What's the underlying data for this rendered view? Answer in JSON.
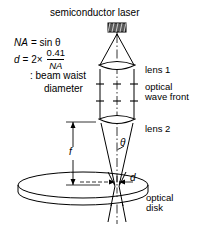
{
  "diagram": {
    "title": "semiconductor laser",
    "formula": {
      "line1_lhs": "NA",
      "line1_rhs": "= sin θ",
      "line2_lhs": "d",
      "line2_op": "= 2×",
      "line2_numerator": "0.41",
      "line2_denominator": "NA",
      "line3": ": beam waist",
      "line4": "diameter"
    },
    "labels": {
      "lens1": "lens 1",
      "lens2": "lens 2",
      "wave_front": "optical\nwave front",
      "wave_front_line1": "optical",
      "wave_front_line2": "wave front",
      "optical_disk_line1": "optical",
      "optical_disk_line2": "disk",
      "focal_length": "f",
      "beam_waist": "d",
      "half_angle": "θ"
    },
    "colors": {
      "stroke": "#000000",
      "background": "#ffffff",
      "laser_fill": "#555555"
    },
    "components": [
      "semiconductor-laser",
      "lens-1",
      "lens-2",
      "optical-disk",
      "optical-wave-front",
      "beam-waist"
    ]
  }
}
